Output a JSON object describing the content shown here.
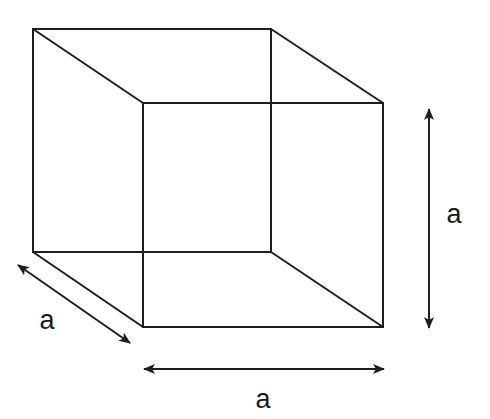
{
  "diagram": {
    "colors": {
      "stroke": "#1e1e1e",
      "background": "#ffffff"
    },
    "cube": {
      "back_face": {
        "tl": [
          33,
          29
        ],
        "tr": [
          271,
          29
        ],
        "br": [
          271,
          252
        ],
        "bl": [
          33,
          252
        ]
      },
      "front_face": {
        "tl": [
          143,
          103
        ],
        "tr": [
          383,
          103
        ],
        "br": [
          383,
          327
        ],
        "bl": [
          143,
          327
        ]
      }
    },
    "labels": {
      "height": "a",
      "depth": "a",
      "width": "a"
    }
  }
}
